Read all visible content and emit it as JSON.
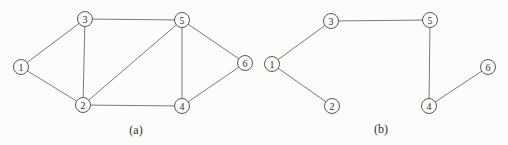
{
  "figure": {
    "background_color": "#fcfcfa",
    "edge_color": "#7a7a78",
    "node_stroke_color": "#585856",
    "node_fill_color": "#fcfcfa",
    "text_color": "#2f2f2d",
    "node_radius": 7.5,
    "chart_data": {
      "type": "node-link-diagram",
      "description_visible_text_only": true,
      "graphs": [
        {
          "name": "a",
          "caption": "(a)",
          "caption_pos": {
            "x": 136,
            "y": 134
          },
          "nodes": [
            {
              "id": "1",
              "x": 21,
              "y": 67
            },
            {
              "id": "2",
              "x": 83,
              "y": 105
            },
            {
              "id": "3",
              "x": 85,
              "y": 19
            },
            {
              "id": "4",
              "x": 182,
              "y": 106
            },
            {
              "id": "5",
              "x": 182,
              "y": 20
            },
            {
              "id": "6",
              "x": 245,
              "y": 63
            }
          ],
          "edges": [
            [
              "1",
              "2"
            ],
            [
              "1",
              "3"
            ],
            [
              "2",
              "3"
            ],
            [
              "2",
              "4"
            ],
            [
              "2",
              "5"
            ],
            [
              "3",
              "5"
            ],
            [
              "4",
              "5"
            ],
            [
              "4",
              "6"
            ],
            [
              "5",
              "6"
            ]
          ]
        },
        {
          "name": "b",
          "caption": "(b)",
          "caption_pos": {
            "x": 381,
            "y": 133
          },
          "nodes": [
            {
              "id": "1",
              "x": 272,
              "y": 64
            },
            {
              "id": "2",
              "x": 332,
              "y": 106
            },
            {
              "id": "3",
              "x": 331,
              "y": 21
            },
            {
              "id": "4",
              "x": 429,
              "y": 106
            },
            {
              "id": "5",
              "x": 430,
              "y": 20
            },
            {
              "id": "6",
              "x": 488,
              "y": 67
            }
          ],
          "edges": [
            [
              "1",
              "2"
            ],
            [
              "1",
              "3"
            ],
            [
              "3",
              "5"
            ],
            [
              "4",
              "5"
            ],
            [
              "4",
              "6"
            ]
          ]
        }
      ]
    }
  }
}
